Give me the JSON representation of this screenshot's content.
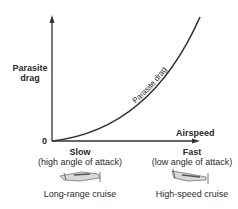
{
  "diagram": {
    "y_axis_label": [
      "Parasite",
      "drag"
    ],
    "x_axis_label": "Airspeed",
    "origin_label": "0",
    "curve_label": "Parasite drag",
    "slow": {
      "title": "Slow",
      "subtitle": "(high angle of attack)",
      "caption": "Long-range cruise",
      "icon": "airplane-nose-up-icon"
    },
    "fast": {
      "title": "Fast",
      "subtitle": "(low angle of attack)",
      "caption": "High-speed cruise",
      "icon": "airplane-nose-down-icon"
    },
    "colors": {
      "line": "#333333",
      "text": "#2a2a2a"
    }
  }
}
